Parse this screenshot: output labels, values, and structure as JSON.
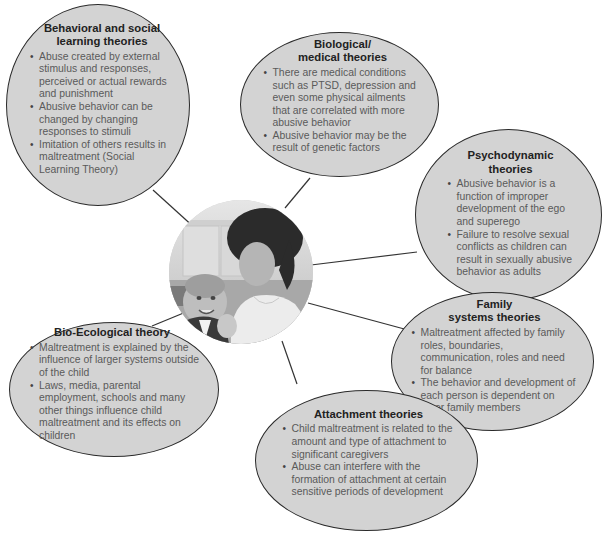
{
  "diagram": {
    "center_image": {
      "label": "photo-mother-holding-baby",
      "alt": "Woman holding a smiling baby"
    },
    "nodes": [
      {
        "id": "behavioral",
        "title": "Behavioral and social learning theories",
        "title_lines": [
          "Behavioral and social",
          "learning theories"
        ],
        "bullets": [
          "Abuse created by external stimulus and responses, perceived or actual rewards and punishment",
          "Abusive behavior can be changed by changing responses to stimuli",
          "Imitation of others results in maltreatment (Social Learning Theory)"
        ]
      },
      {
        "id": "biological",
        "title": "Biological/ medical theories",
        "title_lines": [
          "Biological/",
          "medical theories"
        ],
        "bullets": [
          "There are medical conditions such as PTSD, depression and even some physical ailments that are correlated with more abusive behavior",
          "Abusive behavior may be the result of genetic factors"
        ]
      },
      {
        "id": "psychodynamic",
        "title": "Psychodynamic theories",
        "title_lines": [
          "Psychodynamic",
          "theories"
        ],
        "bullets": [
          "Abusive behavior is a function of improper development of the ego and superego",
          "Failure to resolve sexual conflicts as children can result in sexually abusive behavior as adults"
        ]
      },
      {
        "id": "family",
        "title": "Family systems theories",
        "title_lines": [
          "Family",
          "systems theories"
        ],
        "bullets": [
          "Maltreatment affected by family roles, boundaries, communication, roles and need for balance",
          "The behavior and development of each person is dependent on other family members"
        ]
      },
      {
        "id": "bioecological",
        "title": "Bio-Ecological theory",
        "title_lines": [
          "Bio-Ecological theory"
        ],
        "bullets": [
          "Maltreatment is explained by the influence of larger systems outside of the child",
          "Laws, media, parental employment, schools and many other things influence child maltreatment and its effects on children"
        ]
      },
      {
        "id": "attachment",
        "title": "Attachment theories",
        "title_lines": [
          "Attachment theories"
        ],
        "bullets": [
          "Child maltreatment is related to the amount and type of attachment to significant caregivers",
          "Abuse can interfere with the formation of attachment at certain sensitive periods of development"
        ]
      }
    ],
    "colors": {
      "bubble_fill": "#d3d3d3",
      "bubble_stroke": "#2a2a2a",
      "title_text": "#222222",
      "body_text": "#5a5a5a",
      "connector": "#333333",
      "background": "#ffffff"
    }
  }
}
